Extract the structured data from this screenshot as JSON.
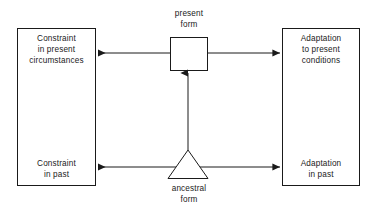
{
  "diagram": {
    "stroke_color": "#1a1a1a",
    "background_color": "#ffffff",
    "nodes": {
      "constraint_present": {
        "shape": "rectangle",
        "label": "Constraint\nin present\ncircumstances"
      },
      "constraint_past": {
        "shape": "rectangle",
        "label": "Constraint\nin past"
      },
      "adaptation_present": {
        "shape": "rectangle",
        "label": "Adaptation\nto present\nconditions"
      },
      "adaptation_past": {
        "shape": "rectangle",
        "label": "Adaptation\nin past"
      },
      "present_form": {
        "shape": "square",
        "label": "present\nform"
      },
      "ancestral_form": {
        "shape": "triangle",
        "label": "ancestral\nform"
      }
    },
    "arrows": [
      {
        "name": "present-form-to-constraint-present",
        "direction": "left",
        "from": "present_form",
        "to": "constraint_present"
      },
      {
        "name": "present-form-to-adaptation-present",
        "direction": "right",
        "from": "present_form",
        "to": "adaptation_present"
      },
      {
        "name": "ancestral-form-to-constraint-past",
        "direction": "left",
        "from": "ancestral_form",
        "to": "constraint_past"
      },
      {
        "name": "ancestral-form-to-adaptation-past",
        "direction": "right",
        "from": "ancestral_form",
        "to": "adaptation_past"
      },
      {
        "name": "ancestral-form-to-present-form",
        "direction": "up",
        "from": "ancestral_form",
        "to": "present_form"
      }
    ]
  }
}
